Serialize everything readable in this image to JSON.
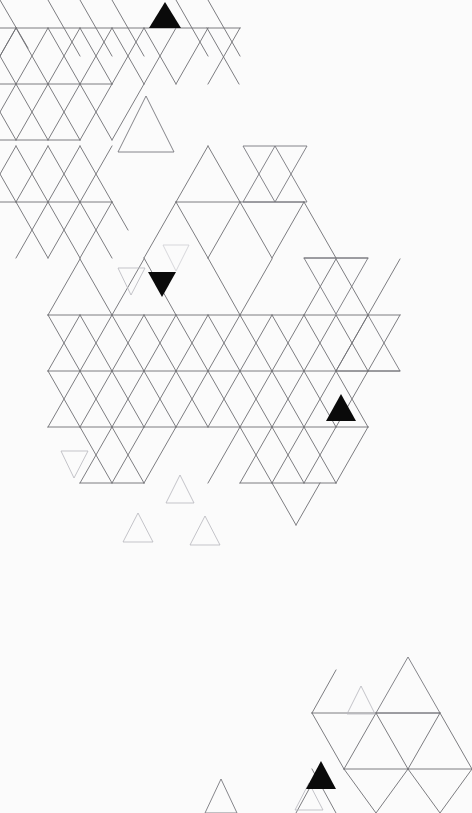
{
  "artwork": {
    "title": "Triangular Lattice Composition",
    "medium": "abstract geometric line drawing",
    "canvas": {
      "width": 472,
      "height": 813
    },
    "background_color": "#ffffff",
    "line_color": "#6e6e73",
    "faint_line_color": "#b9b9bf",
    "accent_color": "#0a0a0a",
    "description": "Scattered equilateral triangle lattice on white paper with a few solid black accent triangles"
  },
  "geometry": {
    "cell_width": 64,
    "cell_height": 56,
    "row_origin_y": 28,
    "notes": "Isometric triangular grid; upward and downward equilateral triangles tile alternately"
  },
  "lattice": {
    "label": "main-lattice",
    "rows": [
      {
        "y": 28,
        "x_start": 16,
        "x_end": 240,
        "segments": 4
      },
      {
        "y": 84,
        "x_start": 48,
        "x_end": 112,
        "segments": 1
      },
      {
        "y": 140,
        "x_start": 16,
        "x_end": 80,
        "segments": 1
      },
      {
        "y": 202,
        "x_start": 16,
        "x_end": 112,
        "segments": 2
      },
      {
        "y": 202,
        "x_start": 176,
        "x_end": 304,
        "segments": 2
      },
      {
        "y": 258,
        "x_start": 304,
        "x_end": 368,
        "segments": 1
      },
      {
        "y": 315,
        "x_start": 48,
        "x_end": 400,
        "segments": 6
      },
      {
        "y": 371,
        "x_start": 48,
        "x_end": 400,
        "segments": 6
      },
      {
        "y": 427,
        "x_start": 48,
        "x_end": 368,
        "segments": 5
      },
      {
        "y": 483,
        "x_start": 80,
        "x_end": 144,
        "segments": 1
      },
      {
        "y": 483,
        "x_start": 240,
        "x_end": 336,
        "segments": 2
      },
      {
        "y": 713,
        "x_start": 312,
        "x_end": 440,
        "segments": 2
      },
      {
        "y": 769,
        "x_start": 344,
        "x_end": 472,
        "segments": 2
      }
    ]
  },
  "triangles": {
    "solid_black": [
      {
        "id": "accent-top",
        "cx": 165,
        "cy": 15,
        "size": 30,
        "direction": "up",
        "label": "solid black upward triangle, top edge"
      },
      {
        "id": "accent-mid",
        "cx": 162,
        "cy": 284,
        "size": 27,
        "direction": "down",
        "label": "solid black downward triangle, centre-left"
      },
      {
        "id": "accent-right",
        "cx": 341,
        "cy": 408,
        "size": 29,
        "direction": "up",
        "label": "solid black upward triangle, centre-right"
      },
      {
        "id": "accent-bottom",
        "cx": 321,
        "cy": 775,
        "size": 28,
        "direction": "up",
        "label": "solid black upward triangle, bottom"
      }
    ],
    "small_outline": [
      {
        "id": "sm-01",
        "cx": 146,
        "cy": 124,
        "size": 56,
        "direction": "up",
        "tone": "normal"
      },
      {
        "id": "sm-02",
        "cx": 176,
        "cy": 258,
        "size": 26,
        "direction": "down",
        "tone": "veryfaint"
      },
      {
        "id": "sm-03",
        "cx": 131,
        "cy": 281,
        "size": 27,
        "direction": "down",
        "tone": "faint"
      },
      {
        "id": "sm-04",
        "cx": 74,
        "cy": 464,
        "size": 27,
        "direction": "down",
        "tone": "faint"
      },
      {
        "id": "sm-05",
        "cx": 180,
        "cy": 489,
        "size": 28,
        "direction": "up",
        "tone": "faint"
      },
      {
        "id": "sm-06",
        "cx": 138,
        "cy": 527,
        "size": 29,
        "direction": "up",
        "tone": "faint"
      },
      {
        "id": "sm-07",
        "cx": 205,
        "cy": 530,
        "size": 29,
        "direction": "up",
        "tone": "faint"
      },
      {
        "id": "sm-08",
        "cx": 361,
        "cy": 700,
        "size": 28,
        "direction": "up",
        "tone": "faint"
      },
      {
        "id": "sm-09",
        "cx": 309,
        "cy": 796,
        "size": 27,
        "direction": "up",
        "tone": "faint"
      },
      {
        "id": "sm-10",
        "cx": 221,
        "cy": 795,
        "size": 32,
        "direction": "up",
        "tone": "normal"
      }
    ],
    "large_outline": [
      {
        "id": "lg-top-right",
        "cx": 243,
        "cy": 60,
        "size": 64,
        "direction": "down",
        "tone": "normal"
      },
      {
        "id": "lg-upper-mid",
        "cx": 243,
        "cy": 174,
        "size": 64,
        "direction": "up",
        "tone": "normal"
      },
      {
        "id": "lg-right-down",
        "cx": 336,
        "cy": 230,
        "size": 64,
        "direction": "down",
        "tone": "normal"
      },
      {
        "id": "lg-right-up",
        "cx": 368,
        "cy": 286,
        "size": 64,
        "direction": "up",
        "tone": "normal"
      },
      {
        "id": "lg-bottom-up",
        "cx": 398,
        "cy": 685,
        "size": 64,
        "direction": "up",
        "tone": "normal"
      },
      {
        "id": "lg-bottom-down",
        "cx": 376,
        "cy": 741,
        "size": 64,
        "direction": "down",
        "tone": "normal"
      }
    ]
  },
  "clusters": [
    {
      "id": "cluster-top-left",
      "label": "dense lattice cluster, upper left"
    },
    {
      "id": "cluster-centre",
      "label": "dense lattice cluster, centre"
    },
    {
      "id": "cluster-bottom-right",
      "label": "sparse lattice cluster, lower right"
    },
    {
      "id": "scatter-field",
      "label": "scattered small triangles field"
    }
  ]
}
